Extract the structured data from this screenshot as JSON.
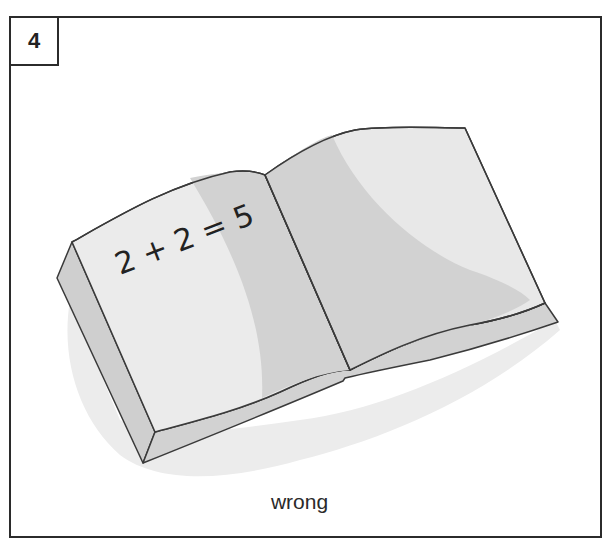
{
  "card": {
    "number": "4",
    "caption": "wrong",
    "page_text": "2 + 2 = 5"
  },
  "illustration": {
    "subject": "open-book-icon",
    "colors": {
      "outline": "#3a3a3a",
      "page_light": "#ebebeb",
      "page_shade": "#d2d2d2",
      "edge": "#cfcfcf",
      "shadow": "#ececec"
    }
  }
}
